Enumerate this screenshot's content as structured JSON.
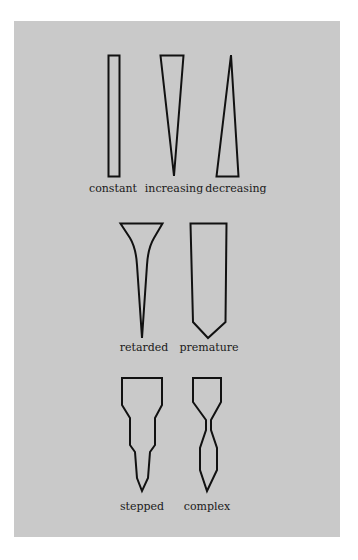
{
  "figure": {
    "background_color": "#c9c9c9",
    "stroke_color": "#111111",
    "rows": [
      {
        "shapes": [
          {
            "id": "constant",
            "label": "constant"
          },
          {
            "id": "increasing",
            "label": "increasing"
          },
          {
            "id": "decreasing",
            "label": "decreasing"
          }
        ]
      },
      {
        "shapes": [
          {
            "id": "retarded",
            "label": "retarded"
          },
          {
            "id": "premature",
            "label": "premature"
          }
        ]
      },
      {
        "shapes": [
          {
            "id": "stepped",
            "label": "stepped"
          },
          {
            "id": "complex",
            "label": "complex"
          }
        ]
      }
    ]
  }
}
